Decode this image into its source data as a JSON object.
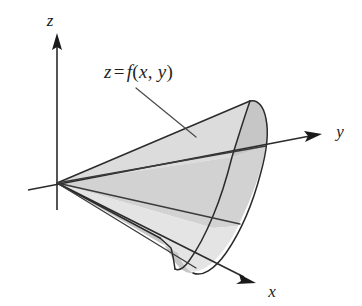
{
  "figure": {
    "type": "diagram",
    "background_color": "#ffffff",
    "line_color": "#2b2b2b",
    "fill_color_upper": "#dcdcdc",
    "fill_color_lower": "#d2d2d2"
  },
  "axes": {
    "origin": {
      "x": 57,
      "y": 183
    },
    "z": {
      "label": "z",
      "label_x": 52,
      "label_y": 22,
      "direction": "up"
    },
    "y": {
      "label": "y",
      "label_x": 340,
      "label_y": 137,
      "direction": "up-right"
    },
    "x": {
      "label": "x",
      "label_x": 272,
      "label_y": 295,
      "direction": "down-right"
    }
  },
  "surface_label": {
    "z": "z",
    "equals": "=",
    "f": "f",
    "open_paren": "(",
    "var_x": "x",
    "comma": ",",
    "var_y": "y",
    "close_paren": ")",
    "full_text": "z = f(x, y)",
    "x": 104,
    "y": 61
  }
}
